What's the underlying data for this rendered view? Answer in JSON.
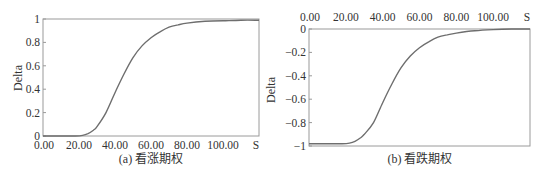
{
  "chart_data": [
    {
      "type": "line",
      "title": "(a) 看涨期权",
      "caption": "(a) 看涨期权",
      "xlabel": "S",
      "ylabel": "Delta",
      "x_tick_labels": [
        "0.00",
        "20.00",
        "40.00",
        "60.00",
        "80.00",
        "100.00",
        "S"
      ],
      "y_tick_labels": [
        "0",
        "0.2",
        "0.4",
        "0.6",
        "0.8",
        "1"
      ],
      "xlim": [
        0,
        120
      ],
      "ylim": [
        0,
        1
      ],
      "x_axis_position": "bottom",
      "grid": false,
      "series": [
        {
          "name": "Call Delta",
          "color": "#6e6e6e",
          "x": [
            0,
            10,
            18,
            22,
            25,
            28,
            30,
            35,
            40,
            45,
            50,
            55,
            60,
            65,
            70,
            75,
            80,
            90,
            100,
            110,
            120
          ],
          "y": [
            0,
            0,
            0,
            0.005,
            0.02,
            0.05,
            0.08,
            0.2,
            0.37,
            0.53,
            0.67,
            0.77,
            0.84,
            0.89,
            0.93,
            0.95,
            0.965,
            0.98,
            0.985,
            0.99,
            0.99
          ]
        }
      ]
    },
    {
      "type": "line",
      "title": "(b) 看跌期权",
      "caption": "(b) 看跌期权",
      "xlabel": "S",
      "ylabel": "Delta",
      "x_tick_labels": [
        "0.00",
        "20.00",
        "40.00",
        "60.00",
        "80.00",
        "100.00",
        "S"
      ],
      "y_tick_labels": [
        "0",
        "-0.2",
        "-0.4",
        "-0.6",
        "-0.8",
        "-1"
      ],
      "xlim": [
        0,
        120
      ],
      "ylim": [
        -1,
        0
      ],
      "x_axis_position": "top",
      "grid": false,
      "series": [
        {
          "name": "Put Delta",
          "color": "#6e6e6e",
          "x": [
            0,
            10,
            18,
            22,
            25,
            28,
            30,
            35,
            40,
            45,
            50,
            55,
            60,
            65,
            70,
            75,
            80,
            90,
            100,
            110,
            120
          ],
          "y": [
            -0.98,
            -0.98,
            -0.98,
            -0.975,
            -0.96,
            -0.93,
            -0.9,
            -0.8,
            -0.63,
            -0.47,
            -0.33,
            -0.23,
            -0.16,
            -0.11,
            -0.07,
            -0.05,
            -0.035,
            -0.015,
            -0.005,
            0,
            0
          ]
        }
      ]
    }
  ]
}
